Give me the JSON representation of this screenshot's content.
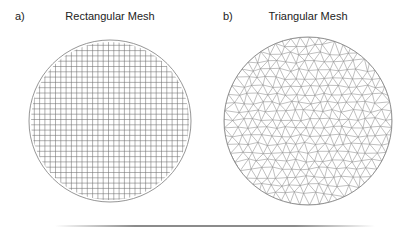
{
  "figure": {
    "panels": [
      {
        "label": "a)",
        "title": "Rectangular Mesh",
        "shape": "circle",
        "mesh_type": "rectangular-grid",
        "circle": {
          "cx": 110,
          "cy": 121,
          "r": 81
        },
        "grid_spacing_px": 5.3
      },
      {
        "label": "b)",
        "title": "Triangular Mesh",
        "shape": "circle",
        "mesh_type": "unstructured-triangular",
        "circle": {
          "cx": 308,
          "cy": 121,
          "r": 84
        },
        "edge_length_px": 9.5
      }
    ],
    "colors": {
      "outline": "#8a8a8a",
      "grid_line": "#6e6e6e",
      "mesh_line": "#8c8c8c",
      "text": "#222222",
      "background": "#ffffff"
    }
  }
}
